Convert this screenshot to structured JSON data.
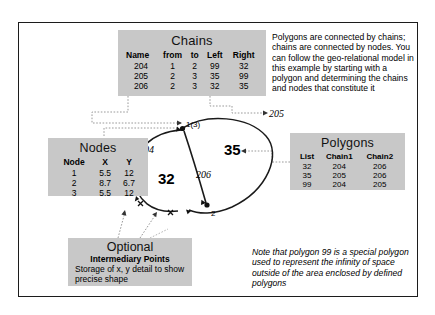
{
  "chains_table": {
    "title": "Chains",
    "columns": [
      "Name",
      "from",
      "to",
      "Left",
      "Right"
    ],
    "rows": [
      [
        "204",
        "1",
        "2",
        "99",
        "32"
      ],
      [
        "205",
        "2",
        "3",
        "35",
        "99"
      ],
      [
        "206",
        "2",
        "3",
        "32",
        "35"
      ]
    ]
  },
  "nodes_table": {
    "title": "Nodes",
    "columns": [
      "Node",
      "X",
      "Y"
    ],
    "rows": [
      [
        "1",
        "5.5",
        "12"
      ],
      [
        "2",
        "8.7",
        "6.7"
      ],
      [
        "3",
        "5.5",
        "12"
      ]
    ]
  },
  "polygons_table": {
    "title": "Polygons",
    "columns": [
      "List",
      "Chain1",
      "Chain2"
    ],
    "rows": [
      [
        "32",
        "204",
        "206"
      ],
      [
        "35",
        "205",
        "206"
      ],
      [
        "99",
        "204",
        "205"
      ]
    ]
  },
  "optional_box": {
    "title": "Optional",
    "subtitle": "Intermediary Points",
    "body": "Storage of x, y detail to show precise shape"
  },
  "intro_text": "Polygons are connected by chains; chains are connected by nodes. You can follow the geo-relational model in this example by starting with a polygon and determining the chains and nodes that constitute it",
  "note_text": "Note that polygon 99 is a special polygon used to represent the infinity of space outside of the area enclosed by defined polygons",
  "canvas_labels": {
    "node13": "1(3)",
    "node2": "2",
    "chain204": "204",
    "chain205": "205",
    "chain206": "206",
    "poly32": "32",
    "poly35": "35"
  }
}
